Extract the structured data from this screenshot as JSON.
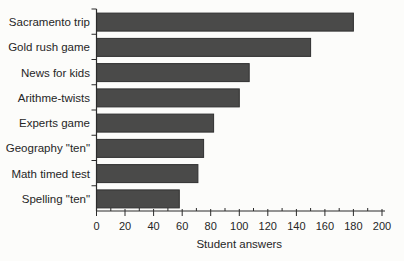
{
  "page": {
    "background": "#fcfcfa"
  },
  "chart_data": {
    "type": "bar",
    "orientation": "horizontal",
    "title": "",
    "xlabel": "Student answers",
    "ylabel": "",
    "categories": [
      "Sacramento trip",
      "Gold rush game",
      "News for kids",
      "Arithme-twists",
      "Experts game",
      "Geography \"ten\"",
      "Math timed test",
      "Spelling \"ten\""
    ],
    "values": [
      180,
      150,
      107,
      100,
      82,
      75,
      71,
      58
    ],
    "xlim": [
      0,
      200
    ],
    "xtick_step": 20,
    "xtick_labels": [
      "0",
      "20",
      "40",
      "60",
      "80",
      "100",
      "120",
      "140",
      "160",
      "180",
      "200"
    ],
    "minor_tick_step": 10,
    "grid": false,
    "legend": null,
    "bar_color": "#4a4a49",
    "bar_edge_color": "#303030",
    "axis_color": "#2b2b2b",
    "text_color": "#262626"
  }
}
